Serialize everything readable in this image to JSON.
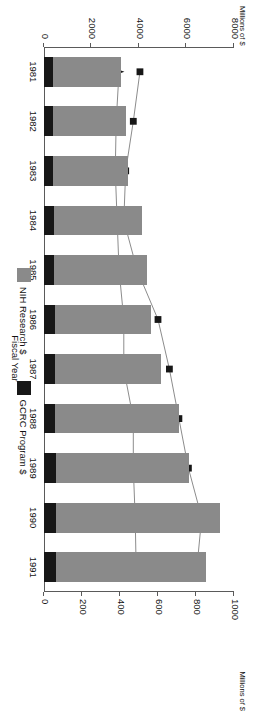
{
  "chart_data": {
    "type": "bar",
    "title": "",
    "xlabel": "Fiscal Year",
    "ylabel": "Millions of $",
    "y2label": "Millions of $",
    "ylim": [
      0,
      8000
    ],
    "y2lim": [
      0,
      1000
    ],
    "grid": false,
    "legend_position": "bottom",
    "categories": [
      "1981",
      "1982",
      "1983",
      "1984",
      "1985",
      "1986",
      "1987",
      "1988",
      "1989",
      "1990",
      "1991"
    ],
    "y_ticks": [
      "0",
      "2000",
      "4000",
      "6000",
      "8000"
    ],
    "y_tick_values": [
      0,
      2000,
      4000,
      6000,
      8000
    ],
    "y2_ticks": [
      "0",
      "200",
      "400",
      "600",
      "800",
      "1000"
    ],
    "y2_tick_values": [
      0,
      200,
      400,
      600,
      800,
      1000
    ],
    "stacked_bars": {
      "stack_order": [
        "GCRC Program $",
        "NIH Research $"
      ],
      "segments": [
        {
          "name": "GCRC Program $",
          "color": "#171717",
          "values": [
            380,
            390,
            400,
            420,
            440,
            450,
            460,
            480,
            490,
            500,
            510
          ]
        },
        {
          "name": "NIH Research $",
          "color": "#8a8a8a",
          "values": [
            2850,
            3060,
            3150,
            3700,
            3900,
            4050,
            4450,
            5220,
            5600,
            6900,
            6300
          ]
        }
      ],
      "totals": [
        3230,
        3450,
        3550,
        4120,
        4340,
        4500,
        4910,
        5700,
        6090,
        7400,
        6810
      ]
    },
    "series": [
      {
        "name": "NIH Research $",
        "marker": "square",
        "color": "#171717",
        "axis": "secondary",
        "values": [
          505,
          470,
          430,
          420,
          490,
          600,
          660,
          710,
          760,
          830,
          805
        ]
      },
      {
        "name": "GCRC Program $",
        "marker": "star",
        "color": "#171717",
        "axis": "secondary",
        "values": [
          395,
          380,
          375,
          385,
          395,
          420,
          420,
          470,
          470,
          480,
          485
        ]
      }
    ]
  },
  "legend": {
    "items": [
      {
        "label": "NIH Research $",
        "color": "#8a8a8a"
      },
      {
        "label": "GCRC Program $",
        "color": "#171717"
      }
    ]
  }
}
